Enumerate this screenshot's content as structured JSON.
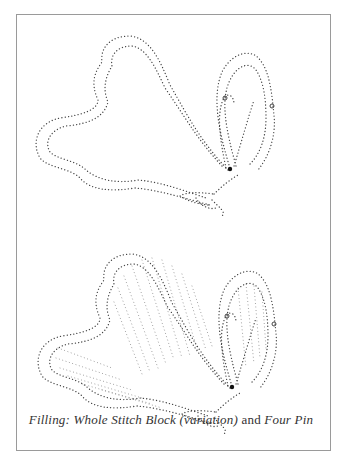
{
  "figure": {
    "top_illustration": "Dotted outline of a butterfly (pricking pattern)",
    "bottom_illustration": "Dotted butterfly with filled wings",
    "caption": {
      "part1": "Filling: Whole Stitch Block (variation)",
      "part2": " and ",
      "part3": "Four Pin"
    }
  },
  "colors": {
    "frame_border": "#9a9a9a",
    "dot": "#444444",
    "fill_dot": "#999999",
    "background": "#ffffff"
  }
}
